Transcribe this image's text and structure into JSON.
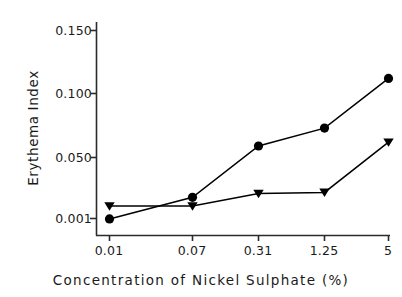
{
  "chart_data": {
    "type": "line",
    "title": "",
    "xlabel": "Concentration of Nickel Sulphate (%)",
    "ylabel": "Erythema Index",
    "categories": [
      "0.01",
      "0.07",
      "0.31",
      "1.25",
      "5"
    ],
    "xtick_labels": [
      "0.01",
      "0.07",
      "0.31",
      "1.25",
      "5"
    ],
    "ytick_labels": [
      "0.001",
      "0.050",
      "0.100",
      "0.150"
    ],
    "ytick_values": [
      0.001,
      0.05,
      0.1,
      0.15
    ],
    "ylim": [
      0.0,
      0.16
    ],
    "grid": false,
    "legend": "none",
    "series": [
      {
        "name": "circle-series",
        "marker": "circle",
        "color": "#000000",
        "values": [
          0.0007,
          0.018,
          0.059,
          0.073,
          0.112
        ]
      },
      {
        "name": "triangle-series",
        "marker": "triangle-down",
        "color": "#000000",
        "values": [
          0.011,
          0.011,
          0.021,
          0.022,
          0.062
        ]
      }
    ]
  },
  "axes": {
    "spine_color": "#2b2b2b",
    "line_color": "#000000",
    "background": "#ffffff"
  }
}
